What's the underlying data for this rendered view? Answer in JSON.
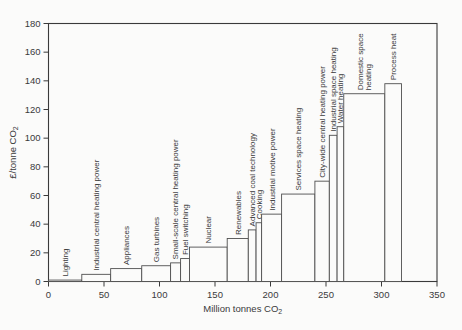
{
  "figure": {
    "background": "#fbfbfa",
    "ink_color": "#3a3a3a",
    "bar_stroke": "#4f4f4f",
    "bar_fill": "#fbfbfa"
  },
  "chart_data": {
    "type": "bar",
    "variant": "marginal-abatement-cost-step-curve",
    "title": "",
    "xlabel": {
      "text": "Million tonnes CO",
      "sub": "2"
    },
    "ylabel": {
      "text": "£/tonne CO",
      "sub": "2"
    },
    "xlim": [
      0,
      350
    ],
    "ylim": [
      0,
      180
    ],
    "x_ticks": [
      0,
      50,
      100,
      150,
      200,
      250,
      300,
      350
    ],
    "y_ticks": [
      0,
      20,
      40,
      60,
      80,
      100,
      120,
      140,
      160,
      180
    ],
    "grid": false,
    "legend": "none",
    "segments": [
      {
        "label": "Lighting",
        "x_from": 0,
        "x_to": 30,
        "cost": 1
      },
      {
        "label": "Industrial central heating power",
        "x_from": 30,
        "x_to": 56,
        "cost": 5
      },
      {
        "label": "Appliances",
        "x_from": 56,
        "x_to": 84,
        "cost": 9
      },
      {
        "label": "Gas turbines",
        "x_from": 84,
        "x_to": 110,
        "cost": 11
      },
      {
        "label": "Small-scale central heating power",
        "x_from": 110,
        "x_to": 119,
        "cost": 13
      },
      {
        "label": "Fuel switching",
        "x_from": 119,
        "x_to": 127,
        "cost": 16
      },
      {
        "label": "Nuclear",
        "x_from": 127,
        "x_to": 161,
        "cost": 24
      },
      {
        "label": "Renewables",
        "x_from": 161,
        "x_to": 180,
        "cost": 30
      },
      {
        "label": "Advanced coal technology",
        "x_from": 180,
        "x_to": 187,
        "cost": 36
      },
      {
        "label": "Cooking",
        "x_from": 187,
        "x_to": 192,
        "cost": 41
      },
      {
        "label": "Industrial motive power",
        "x_from": 192,
        "x_to": 210,
        "cost": 47
      },
      {
        "label": "Services space heating",
        "x_from": 210,
        "x_to": 240,
        "cost": 61
      },
      {
        "label": "City-wide central heating power",
        "x_from": 240,
        "x_to": 253,
        "cost": 70
      },
      {
        "label": "Industrial space heating",
        "x_from": 253,
        "x_to": 260,
        "cost": 102
      },
      {
        "label": "Water heating",
        "x_from": 260,
        "x_to": 266,
        "cost": 108
      },
      {
        "label": "Domestic space heating",
        "label_lines": [
          "Domestic space",
          "heating"
        ],
        "x_from": 266,
        "x_to": 303,
        "cost": 131
      },
      {
        "label": "Process heat",
        "x_from": 303,
        "x_to": 318,
        "cost": 138
      }
    ]
  }
}
